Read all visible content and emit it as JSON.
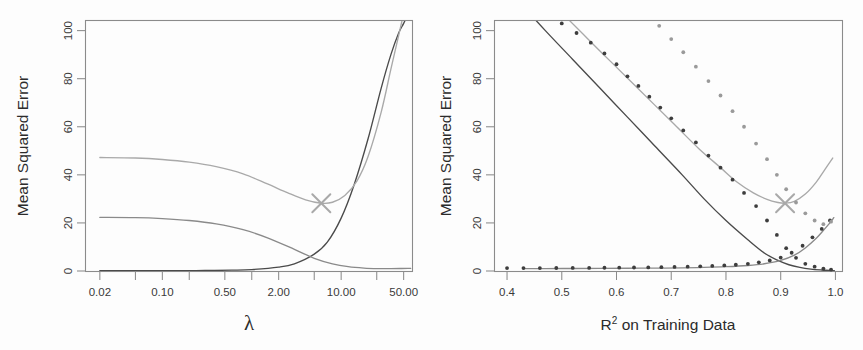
{
  "figure": {
    "background_color": "#fdfdfd",
    "panel_count": 2
  },
  "colors": {
    "bias_black": "#4a4a4a",
    "variance_green": "#8a8a8a",
    "test_mse_purple": "#a9a9a9",
    "frame_gray": "#8b8b8b",
    "text_dark": "#2b2b2b",
    "dot_dark": "#3d3d3d",
    "dot_light": "#9a9a9a"
  },
  "left_panel": {
    "ylabel": "Mean Squared Error",
    "xlabel": "λ",
    "x_tick_labels": [
      "0.02",
      "0.10",
      "0.50",
      "2.00",
      "10.00",
      "50.00"
    ],
    "y_tick_labels": [
      "0",
      "20",
      "40",
      "60",
      "80",
      "100"
    ],
    "marker": {
      "label": "x-marker",
      "x_value": 6.0,
      "y_value": 28.2
    }
  },
  "right_panel": {
    "ylabel": "Mean Squared Error",
    "xlabel_main": "on Training Data",
    "xlabel_base": "R",
    "xlabel_sup": "2",
    "x_tick_labels": [
      "0.4",
      "0.5",
      "0.6",
      "0.7",
      "0.8",
      "0.9",
      "1.0"
    ],
    "y_tick_labels": [
      "0",
      "20",
      "40",
      "60",
      "80",
      "100"
    ],
    "marker": {
      "label": "x-marker",
      "x_value": 0.908,
      "y_value": 28.2
    }
  },
  "chart_data": [
    {
      "type": "line",
      "panel": "left",
      "title": "",
      "xlabel": "λ",
      "ylabel": "Mean Squared Error",
      "xscale": "log",
      "xlim": [
        0.014,
        62
      ],
      "ylim": [
        0,
        104
      ],
      "xticks": [
        0.02,
        0.1,
        0.5,
        2.0,
        10.0,
        50.0
      ],
      "xticklabels": [
        "0.02",
        "0.10",
        "0.50",
        "2.00",
        "10.00",
        "50.00"
      ],
      "yticks": [
        0,
        20,
        40,
        60,
        80,
        100
      ],
      "yticklabels": [
        "0",
        "20",
        "40",
        "60",
        "80",
        "100"
      ],
      "grid": false,
      "legend": "none",
      "series": [
        {
          "name": "Squared Bias",
          "color": "#4a4a4a",
          "x": [
            0.02,
            0.04,
            0.08,
            0.15,
            0.3,
            0.6,
            1.0,
            2.0,
            3.0,
            5.0,
            7.0,
            10.0,
            14.0,
            20.0,
            28.0,
            36.0,
            44.0,
            50.0,
            56.0,
            60.0
          ],
          "y": [
            0.1,
            0.1,
            0.12,
            0.15,
            0.2,
            0.35,
            0.6,
            1.6,
            3.0,
            7.0,
            12.0,
            22.0,
            36.0,
            55.0,
            76.0,
            90.0,
            99.0,
            103.0,
            107.0,
            110.0
          ]
        },
        {
          "name": "Variance",
          "color": "#8a8a8a",
          "x": [
            0.02,
            0.05,
            0.1,
            0.2,
            0.4,
            0.8,
            1.5,
            3.0,
            5.0,
            8.0,
            12.0,
            18.0,
            26.0,
            36.0,
            46.0,
            56.0,
            60.0
          ],
          "y": [
            22.3,
            22.2,
            21.8,
            21.0,
            19.6,
            17.2,
            13.8,
            9.0,
            5.3,
            3.0,
            1.8,
            1.2,
            1.0,
            1.0,
            1.05,
            1.1,
            1.1
          ]
        },
        {
          "name": "Test MSE",
          "color": "#a9a9a9",
          "x": [
            0.02,
            0.05,
            0.1,
            0.2,
            0.4,
            0.8,
            1.5,
            2.5,
            4.0,
            6.0,
            8.0,
            11.0,
            15.0,
            20.0,
            28.0,
            36.0,
            44.0,
            52.0,
            60.0
          ],
          "y": [
            47.2,
            47.0,
            46.4,
            45.3,
            43.4,
            40.4,
            36.2,
            32.6,
            29.6,
            28.2,
            28.6,
            31.4,
            37.4,
            47.6,
            66.0,
            84.0,
            98.0,
            110.0,
            120.0
          ]
        }
      ],
      "annotations": [
        {
          "type": "x-marker",
          "x": 6.0,
          "y": 28.2,
          "color": "#a9a9a9"
        }
      ]
    },
    {
      "type": "line",
      "panel": "right",
      "title": "",
      "xlabel": "R^2 on Training Data",
      "ylabel": "Mean Squared Error",
      "xscale": "linear",
      "xlim": [
        0.378,
        1.012
      ],
      "ylim": [
        0,
        104
      ],
      "xticks": [
        0.4,
        0.5,
        0.6,
        0.7,
        0.8,
        0.9,
        1.0
      ],
      "xticklabels": [
        "0.4",
        "0.5",
        "0.6",
        "0.7",
        "0.8",
        "0.9",
        "1.0"
      ],
      "yticks": [
        0,
        20,
        40,
        60,
        80,
        100
      ],
      "yticklabels": [
        "0",
        "20",
        "40",
        "60",
        "80",
        "100"
      ],
      "grid": false,
      "legend": "none",
      "series": [
        {
          "name": "Squared Bias",
          "color": "#4a4a4a",
          "style": "line",
          "x": [
            0.43,
            0.47,
            0.52,
            0.57,
            0.62,
            0.67,
            0.72,
            0.76,
            0.8,
            0.84,
            0.87,
            0.895,
            0.915,
            0.935,
            0.955,
            0.975,
            0.99,
            0.998
          ],
          "y": [
            110.0,
            100.0,
            88.0,
            76.0,
            64.0,
            52.0,
            40.0,
            30.0,
            21.0,
            13.0,
            7.5,
            4.4,
            2.6,
            1.5,
            0.8,
            0.4,
            0.2,
            0.15
          ]
        },
        {
          "name": "Variance",
          "color": "#8a8a8a",
          "style": "line",
          "x": [
            0.43,
            0.47,
            0.52,
            0.57,
            0.62,
            0.67,
            0.72,
            0.76,
            0.8,
            0.84,
            0.87,
            0.9,
            0.925,
            0.945,
            0.965,
            0.98,
            0.99,
            0.997
          ],
          "y": [
            1.0,
            1.0,
            1.05,
            1.1,
            1.15,
            1.2,
            1.3,
            1.5,
            1.8,
            2.3,
            3.0,
            4.4,
            6.6,
            9.6,
            13.6,
            17.4,
            20.0,
            22.2
          ]
        },
        {
          "name": "Test MSE",
          "color": "#a9a9a9",
          "style": "line",
          "x": [
            0.515,
            0.55,
            0.59,
            0.63,
            0.67,
            0.71,
            0.75,
            0.79,
            0.82,
            0.85,
            0.875,
            0.895,
            0.908,
            0.925,
            0.945,
            0.965,
            0.98,
            0.995
          ],
          "y": [
            104.0,
            96.0,
            87.0,
            78.0,
            69.0,
            60.0,
            51.0,
            43.0,
            37.0,
            32.5,
            29.8,
            28.5,
            28.2,
            29.0,
            32.0,
            37.0,
            42.0,
            47.0
          ]
        },
        {
          "name": "Squared Bias points",
          "color": "#3d3d3d",
          "style": "points",
          "x": [
            0.5,
            0.527,
            0.553,
            0.578,
            0.6,
            0.62,
            0.64,
            0.66,
            0.68,
            0.7,
            0.722,
            0.745,
            0.768,
            0.79,
            0.812,
            0.833,
            0.855,
            0.875,
            0.893,
            0.91,
            0.928,
            0.945,
            0.962,
            0.978,
            0.992
          ],
          "y": [
            103.0,
            99.0,
            95.0,
            90.5,
            86.0,
            81.0,
            77.0,
            72.5,
            68.0,
            63.5,
            58.5,
            53.5,
            48.0,
            43.0,
            38.0,
            32.5,
            27.0,
            21.0,
            15.0,
            9.5,
            5.5,
            3.0,
            1.8,
            1.0,
            0.6
          ]
        },
        {
          "name": "Variance points",
          "color": "#3d3d3d",
          "style": "points",
          "x": [
            0.4,
            0.43,
            0.46,
            0.49,
            0.52,
            0.55,
            0.578,
            0.605,
            0.632,
            0.658,
            0.682,
            0.706,
            0.73,
            0.753,
            0.775,
            0.797,
            0.818,
            0.84,
            0.86,
            0.88,
            0.9,
            0.92,
            0.94,
            0.958,
            0.975,
            0.99
          ],
          "y": [
            1.2,
            1.2,
            1.2,
            1.25,
            1.3,
            1.3,
            1.35,
            1.4,
            1.45,
            1.5,
            1.6,
            1.7,
            1.8,
            1.95,
            2.1,
            2.3,
            2.6,
            3.0,
            3.6,
            4.4,
            5.6,
            7.6,
            10.5,
            14.0,
            17.5,
            21.0
          ]
        },
        {
          "name": "Test MSE points",
          "color": "#9a9a9a",
          "style": "points",
          "x": [
            0.678,
            0.7,
            0.722,
            0.745,
            0.768,
            0.79,
            0.812,
            0.833,
            0.855,
            0.875,
            0.893,
            0.91,
            0.928,
            0.945,
            0.962,
            0.978,
            0.992
          ],
          "y": [
            102.0,
            96.5,
            91.0,
            85.0,
            79.0,
            73.0,
            66.5,
            60.0,
            53.0,
            46.5,
            40.0,
            34.0,
            28.5,
            24.0,
            21.0,
            19.5,
            20.5
          ]
        }
      ],
      "annotations": [
        {
          "type": "x-marker",
          "x": 0.908,
          "y": 28.2,
          "color": "#a9a9a9"
        }
      ]
    }
  ]
}
